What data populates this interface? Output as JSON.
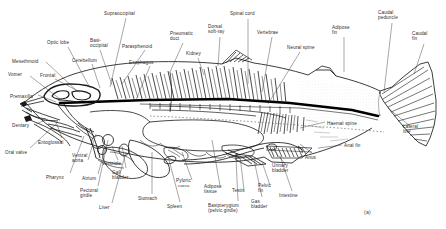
{
  "figure": {
    "panel_id": "(a)",
    "colors": {
      "ink": "#1a1a1a",
      "label_text": "#2b2b2b",
      "background": "#ffffff",
      "spinal_cord_fill": "#000000"
    }
  },
  "labels": [
    {
      "text": "Supraoccipital",
      "x": 104,
      "y": 11,
      "align": "left"
    },
    {
      "text": "Basi-\noccipital",
      "x": 90,
      "y": 38,
      "align": "left"
    },
    {
      "text": "Parasphenoid",
      "x": 122,
      "y": 44,
      "align": "left"
    },
    {
      "text": "Pneumatic\nduct",
      "x": 170,
      "y": 31,
      "align": "left"
    },
    {
      "text": "Spinal cord",
      "x": 230,
      "y": 11,
      "align": "left"
    },
    {
      "text": "Dorsal\nsoft-ray",
      "x": 208,
      "y": 24,
      "align": "left"
    },
    {
      "text": "Vertebrae",
      "x": 257,
      "y": 30,
      "align": "left"
    },
    {
      "text": "Adipose\nfin",
      "x": 332,
      "y": 25,
      "align": "left"
    },
    {
      "text": "Caudal\npeduncle",
      "x": 378,
      "y": 10,
      "align": "left"
    },
    {
      "text": "Caudal\nfin",
      "x": 412,
      "y": 31,
      "align": "left"
    },
    {
      "text": "Optic lobe",
      "x": 47,
      "y": 40,
      "align": "left"
    },
    {
      "text": "Cerebellum",
      "x": 72,
      "y": 58,
      "align": "left"
    },
    {
      "text": "Esophagus",
      "x": 129,
      "y": 60,
      "align": "left"
    },
    {
      "text": "Kidney",
      "x": 186,
      "y": 51,
      "align": "left"
    },
    {
      "text": "Neural spine",
      "x": 287,
      "y": 45,
      "align": "left"
    },
    {
      "text": "Mesethmoid",
      "x": 12,
      "y": 59,
      "align": "left"
    },
    {
      "text": "Vomer",
      "x": 8,
      "y": 72,
      "align": "left"
    },
    {
      "text": "Frontal",
      "x": 40,
      "y": 73,
      "align": "left"
    },
    {
      "text": "Premaxilla",
      "x": 10,
      "y": 94,
      "align": "left"
    },
    {
      "text": "Dentary",
      "x": 12,
      "y": 123,
      "align": "left"
    },
    {
      "text": "Oral valve",
      "x": 5,
      "y": 150,
      "align": "left"
    },
    {
      "text": "Entoglossal",
      "x": 38,
      "y": 140,
      "align": "left"
    },
    {
      "text": "Pharynx",
      "x": 46,
      "y": 175,
      "align": "left"
    },
    {
      "text": "Ventral\naorta",
      "x": 72,
      "y": 153,
      "align": "left"
    },
    {
      "text": "Atrium",
      "x": 82,
      "y": 176,
      "align": "left"
    },
    {
      "text": "Ventricle",
      "x": 102,
      "y": 161,
      "align": "left"
    },
    {
      "text": "Pectoral\ngirdle",
      "x": 80,
      "y": 188,
      "align": "left"
    },
    {
      "text": "Gall\nbladder",
      "x": 112,
      "y": 170,
      "align": "left"
    },
    {
      "text": "Liver",
      "x": 99,
      "y": 205,
      "align": "left"
    },
    {
      "text": "Stomach",
      "x": 138,
      "y": 196,
      "align": "left"
    },
    {
      "text": "Spleen",
      "x": 167,
      "y": 204,
      "align": "left"
    },
    {
      "text": "Pyloric",
      "x": 176,
      "y": 178,
      "align": "left"
    },
    {
      "text": "caeca",
      "x": 178,
      "y": 184,
      "align": "left",
      "small": true
    },
    {
      "text": "Adipose\ntissue",
      "x": 204,
      "y": 184,
      "align": "left"
    },
    {
      "text": "Testis",
      "x": 232,
      "y": 188,
      "align": "left"
    },
    {
      "text": "Basipterygium\n(pelvic girdle)",
      "x": 208,
      "y": 203,
      "align": "left"
    },
    {
      "text": "Gas\nbladder",
      "x": 251,
      "y": 199,
      "align": "left"
    },
    {
      "text": "Pelvic\nfin",
      "x": 258,
      "y": 183,
      "align": "left"
    },
    {
      "text": "Urinary\nbladder",
      "x": 272,
      "y": 163,
      "align": "left"
    },
    {
      "text": "Intestine",
      "x": 279,
      "y": 193,
      "align": "left"
    },
    {
      "text": "Anus",
      "x": 305,
      "y": 155,
      "align": "left"
    },
    {
      "text": "Haemal spine",
      "x": 327,
      "y": 121,
      "align": "left"
    },
    {
      "text": "Anal fin",
      "x": 344,
      "y": 143,
      "align": "left"
    },
    {
      "text": "Lateral\nline",
      "x": 403,
      "y": 124,
      "align": "left"
    }
  ],
  "leaders": [
    {
      "from": [
        126,
        18
      ],
      "to": [
        110,
        87
      ]
    },
    {
      "from": [
        100,
        50
      ],
      "to": [
        112,
        85
      ]
    },
    {
      "from": [
        145,
        50
      ],
      "to": [
        122,
        84
      ]
    },
    {
      "from": [
        183,
        43
      ],
      "to": [
        170,
        72
      ]
    },
    {
      "from": [
        248,
        19
      ],
      "to": [
        248,
        84
      ]
    },
    {
      "from": [
        220,
        37
      ],
      "to": [
        218,
        66
      ]
    },
    {
      "from": [
        272,
        37
      ],
      "to": [
        262,
        92
      ]
    },
    {
      "from": [
        344,
        37
      ],
      "to": [
        344,
        72
      ]
    },
    {
      "from": [
        392,
        23
      ],
      "to": [
        384,
        92
      ]
    },
    {
      "from": [
        424,
        44
      ],
      "to": [
        414,
        74
      ]
    },
    {
      "from": [
        68,
        47
      ],
      "to": [
        90,
        88
      ]
    },
    {
      "from": [
        92,
        64
      ],
      "to": [
        100,
        88
      ]
    },
    {
      "from": [
        150,
        66
      ],
      "to": [
        136,
        100
      ]
    },
    {
      "from": [
        198,
        58
      ],
      "to": [
        204,
        75
      ]
    },
    {
      "from": [
        300,
        52
      ],
      "to": [
        268,
        104
      ]
    },
    {
      "from": [
        46,
        62
      ],
      "to": [
        78,
        92
      ]
    },
    {
      "from": [
        30,
        76
      ],
      "to": [
        60,
        99
      ]
    },
    {
      "from": [
        55,
        79
      ],
      "to": [
        80,
        92
      ]
    },
    {
      "from": [
        38,
        95
      ],
      "to": [
        56,
        102
      ]
    },
    {
      "from": [
        36,
        124
      ],
      "to": [
        48,
        119
      ]
    },
    {
      "from": [
        30,
        148
      ],
      "to": [
        56,
        124
      ]
    },
    {
      "from": [
        62,
        138
      ],
      "to": [
        56,
        122
      ]
    },
    {
      "from": [
        70,
        173
      ],
      "to": [
        84,
        136
      ]
    },
    {
      "from": [
        88,
        160
      ],
      "to": [
        96,
        134
      ]
    },
    {
      "from": [
        98,
        174
      ],
      "to": [
        106,
        146
      ]
    },
    {
      "from": [
        118,
        160
      ],
      "to": [
        112,
        146
      ]
    },
    {
      "from": [
        98,
        186
      ],
      "to": [
        108,
        140
      ]
    },
    {
      "from": [
        126,
        168
      ],
      "to": [
        122,
        146
      ]
    },
    {
      "from": [
        112,
        203
      ],
      "to": [
        126,
        152
      ]
    },
    {
      "from": [
        152,
        194
      ],
      "to": [
        152,
        152
      ]
    },
    {
      "from": [
        180,
        202
      ],
      "to": [
        168,
        156
      ]
    },
    {
      "from": [
        192,
        180
      ],
      "to": [
        182,
        152
      ]
    },
    {
      "from": [
        220,
        186
      ],
      "to": [
        212,
        140
      ]
    },
    {
      "from": [
        244,
        190
      ],
      "to": [
        240,
        156
      ]
    },
    {
      "from": [
        238,
        201
      ],
      "to": [
        236,
        158
      ]
    },
    {
      "from": [
        262,
        197
      ],
      "to": [
        254,
        160
      ]
    },
    {
      "from": [
        270,
        185
      ],
      "to": [
        262,
        162
      ]
    },
    {
      "from": [
        286,
        165
      ],
      "to": [
        272,
        148
      ]
    },
    {
      "from": [
        292,
        191
      ],
      "to": [
        280,
        156
      ]
    },
    {
      "from": [
        312,
        153
      ],
      "to": [
        300,
        144
      ]
    },
    {
      "from": [
        325,
        122
      ],
      "to": [
        300,
        128
      ]
    },
    {
      "from": [
        342,
        145
      ],
      "to": [
        318,
        148
      ]
    },
    {
      "from": [
        410,
        126
      ],
      "to": [
        388,
        108
      ]
    }
  ]
}
